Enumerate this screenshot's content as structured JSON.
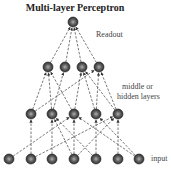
{
  "title": "Multi-layer Perceptron",
  "labels": {
    "readout": "Readout",
    "hidden_line1": "middle or",
    "hidden_line2": "hidden layers",
    "input": "input"
  },
  "colors": {
    "node_outer": "#3a3a3a",
    "node_inner": "#9a9a9a",
    "edge": "#555555"
  },
  "layers": [
    {
      "name": "readout",
      "y": 22,
      "x": [
        73
      ]
    },
    {
      "name": "hidden2",
      "y": 67,
      "x": [
        48,
        65,
        82,
        99
      ]
    },
    {
      "name": "hidden1",
      "y": 114,
      "x": [
        31,
        52,
        74,
        96,
        118
      ]
    },
    {
      "name": "input",
      "y": 159,
      "x": [
        9,
        31,
        52,
        74,
        96,
        118,
        139
      ]
    }
  ],
  "edges": [
    [
      [
        1,
        0
      ],
      [
        0,
        0
      ]
    ],
    [
      [
        1,
        1
      ],
      [
        0,
        0
      ]
    ],
    [
      [
        1,
        2
      ],
      [
        0,
        0
      ]
    ],
    [
      [
        1,
        3
      ],
      [
        0,
        0
      ]
    ],
    [
      [
        2,
        0
      ],
      [
        1,
        0
      ]
    ],
    [
      [
        2,
        1
      ],
      [
        1,
        0
      ]
    ],
    [
      [
        2,
        1
      ],
      [
        1,
        1
      ]
    ],
    [
      [
        2,
        2
      ],
      [
        1,
        0
      ]
    ],
    [
      [
        2,
        2
      ],
      [
        1,
        2
      ]
    ],
    [
      [
        2,
        3
      ],
      [
        1,
        3
      ]
    ],
    [
      [
        2,
        3
      ],
      [
        1,
        2
      ]
    ],
    [
      [
        2,
        4
      ],
      [
        1,
        3
      ]
    ],
    [
      [
        2,
        0
      ],
      [
        1,
        3
      ]
    ],
    [
      [
        2,
        4
      ],
      [
        1,
        2
      ]
    ],
    [
      [
        3,
        0
      ],
      [
        2,
        2
      ]
    ],
    [
      [
        3,
        1
      ],
      [
        2,
        0
      ]
    ],
    [
      [
        3,
        2
      ],
      [
        2,
        1
      ]
    ],
    [
      [
        3,
        3
      ],
      [
        2,
        1
      ]
    ],
    [
      [
        3,
        3
      ],
      [
        2,
        2
      ]
    ],
    [
      [
        3,
        3
      ],
      [
        2,
        4
      ]
    ],
    [
      [
        3,
        4
      ],
      [
        2,
        1
      ]
    ],
    [
      [
        3,
        4
      ],
      [
        2,
        3
      ]
    ],
    [
      [
        3,
        5
      ],
      [
        2,
        4
      ]
    ],
    [
      [
        3,
        6
      ],
      [
        2,
        3
      ]
    ],
    [
      [
        3,
        6
      ],
      [
        2,
        2
      ]
    ],
    [
      [
        3,
        1
      ],
      [
        2,
        4
      ]
    ]
  ]
}
